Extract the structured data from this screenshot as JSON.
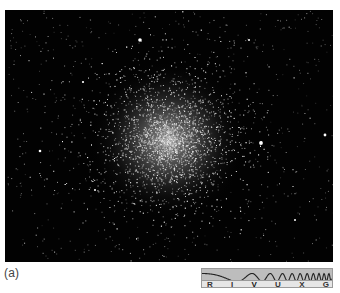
{
  "figure": {
    "caption": "(a)",
    "photo": {
      "subject": "globular-star-cluster",
      "background_color": "#020202",
      "cluster_center": [
        163,
        130
      ],
      "bright_stars": [
        [
          135,
          30,
          1.8
        ],
        [
          256,
          133,
          1.9
        ],
        [
          320,
          125,
          1.4
        ],
        [
          35,
          141,
          1.3
        ],
        [
          78,
          72,
          1.1
        ],
        [
          244,
          30,
          1.0
        ],
        [
          90,
          180,
          1.0
        ],
        [
          290,
          210,
          1.0
        ]
      ]
    },
    "spectrum_bar": {
      "bands": [
        "R",
        "I",
        "V",
        "U",
        "X",
        "G"
      ],
      "highlighted": "V",
      "band_color": "#bdbdbd",
      "label_bg_color": "#e6e6e6",
      "wave_color": "#222222"
    }
  }
}
